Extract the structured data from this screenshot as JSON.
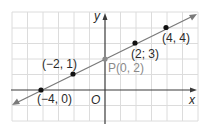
{
  "diagram": {
    "type": "coordinate-plane-line",
    "axes": {
      "x_label": "x",
      "y_label": "y",
      "origin_label": "O"
    },
    "grid": {
      "x_min": -6,
      "x_max": 6,
      "y_min": -2,
      "y_max": 5
    },
    "line": {
      "slope": 0.5,
      "intercept": 2,
      "color": "#7a7a7a"
    },
    "points": [
      {
        "label": "(−4, 0)",
        "x": -4,
        "y": 0
      },
      {
        "label": "(−2, 1)",
        "x": -2,
        "y": 1
      },
      {
        "label": "P(0, 2)",
        "x": 0,
        "y": 2,
        "highlight": true
      },
      {
        "label": "(2; 3)",
        "x": 2,
        "y": 3
      },
      {
        "label": "(4, 4)",
        "x": 4,
        "y": 4
      }
    ]
  },
  "colors": {
    "grid": "#dcdcdc",
    "axis": "#3a3a3a",
    "line": "#7a7a7a",
    "point": "#111111",
    "p_label": "#8a8a8a"
  }
}
